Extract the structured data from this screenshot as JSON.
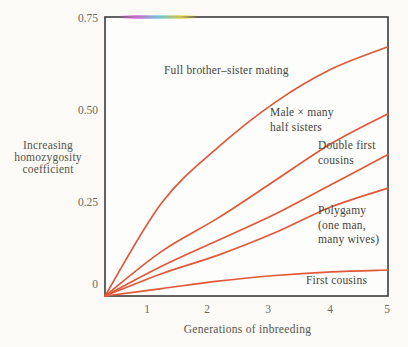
{
  "figure": {
    "background": "#fbfaf6",
    "plot_fill": "#fdfdfb",
    "frame_color": "#3c3c3c",
    "tick_text_color": "#6b6a62",
    "label_text_color": "#45443c",
    "y_axis_title": "Increasing\nhomozygosity\ncoefficient",
    "x_axis_title": "Generations of inbreeding",
    "y_ticks": [
      "0.75",
      "0.50",
      "0.25",
      "0"
    ],
    "x_ticks": [
      "1",
      "2",
      "3",
      "4",
      "5"
    ]
  },
  "chart_data": {
    "type": "line",
    "title": "",
    "xlabel": "Generations of inbreeding",
    "ylabel": "Increasing homozygosity coefficient",
    "x": [
      0,
      1,
      2,
      3,
      4,
      5
    ],
    "xlim": [
      0,
      5
    ],
    "ylim": [
      0,
      0.75
    ],
    "x_tick_values": [
      1,
      2,
      3,
      4,
      5
    ],
    "y_tick_values": [
      0.75,
      0.5,
      0.25,
      0
    ],
    "grid": false,
    "legend": "inline labels beside curves",
    "line_color": "#e0583a",
    "series": [
      {
        "name": "Full brother–sister mating",
        "label": "Full brother–sister mating",
        "values": [
          0,
          0.25,
          0.4,
          0.52,
          0.61,
          0.67
        ]
      },
      {
        "name": "Male × many half sisters",
        "label": "Male × many\nhalf sisters",
        "values": [
          0,
          0.12,
          0.21,
          0.31,
          0.41,
          0.49
        ]
      },
      {
        "name": "Double first cousins",
        "label": "Double first\ncousins",
        "values": [
          0,
          0.08,
          0.15,
          0.22,
          0.3,
          0.38
        ]
      },
      {
        "name": "Polygamy (one man, many wives)",
        "label": "Polygamy\n(one man,\nmany wives)",
        "values": [
          0,
          0.06,
          0.11,
          0.17,
          0.24,
          0.29
        ]
      },
      {
        "name": "First cousins",
        "label": "First cousins",
        "values": [
          0,
          0.02,
          0.04,
          0.055,
          0.065,
          0.07
        ]
      }
    ]
  }
}
